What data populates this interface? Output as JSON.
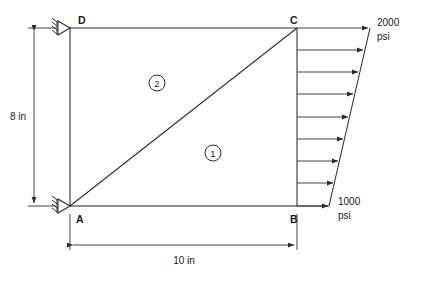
{
  "figure": {
    "nodes": [
      {
        "id": "A",
        "label": "A",
        "x_in": 0,
        "y_in": 0,
        "support": "fixed"
      },
      {
        "id": "B",
        "label": "B",
        "x_in": 10,
        "y_in": 0,
        "support": "none"
      },
      {
        "id": "C",
        "label": "C",
        "x_in": 10,
        "y_in": 8,
        "support": "none"
      },
      {
        "id": "D",
        "label": "D",
        "x_in": 0,
        "y_in": 8,
        "support": "fixed"
      }
    ],
    "elements": [
      {
        "label": "1",
        "nodes": "A-B-C"
      },
      {
        "label": "2",
        "nodes": "A-C-D"
      }
    ],
    "dimensions": [
      {
        "name": "height",
        "label": "8 in",
        "orientation": "vertical",
        "value": 8,
        "unit": "in"
      },
      {
        "name": "width",
        "label": "10 in",
        "orientation": "horizontal",
        "value": 10,
        "unit": "in"
      }
    ],
    "load": {
      "edge": "B-C",
      "type": "linearly-varying-pressure",
      "top_value": "2000",
      "top_unit": "psi",
      "bottom_value": "1000",
      "bottom_unit": "psi",
      "arrow_count": 9,
      "direction": "rightward"
    },
    "colors": {
      "line": "#2b2b2b",
      "text": "#1a1a1a",
      "background": "#ffffff"
    }
  }
}
